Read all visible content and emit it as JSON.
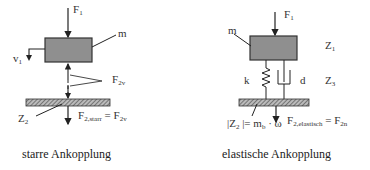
{
  "left_diagram": {
    "force_in": {
      "main": "F",
      "sub": "1"
    },
    "mass_label": "m",
    "velocity": {
      "main": "v",
      "sub": "1"
    },
    "spring_force": {
      "main": "F",
      "sub": "2v"
    },
    "impedance": {
      "main": "Z",
      "sub": "2"
    },
    "force_out": {
      "main": "F",
      "sub": "2,starr",
      "eq": " = F",
      "eq_sub": "2v"
    },
    "caption": "starre Ankopplung"
  },
  "right_diagram": {
    "force_in": {
      "main": "F",
      "sub": "1"
    },
    "mass_label": "m",
    "z1": {
      "main": "Z",
      "sub": "1"
    },
    "spring_label": "k",
    "damper_label": "d",
    "z3": {
      "main": "Z",
      "sub": "3"
    },
    "impedance_formula": {
      "pre": "|Z",
      "sub": "2",
      "mid": " |= m",
      "sub2": "b",
      "post": " · ω"
    },
    "force_out": {
      "main": "F",
      "sub": "2,elastisch",
      "eq": " = F",
      "eq_sub": "2n"
    },
    "caption": "elastische Ankopplung"
  },
  "colors": {
    "mass_fill": "#8f8f8f",
    "stroke": "#222222"
  }
}
